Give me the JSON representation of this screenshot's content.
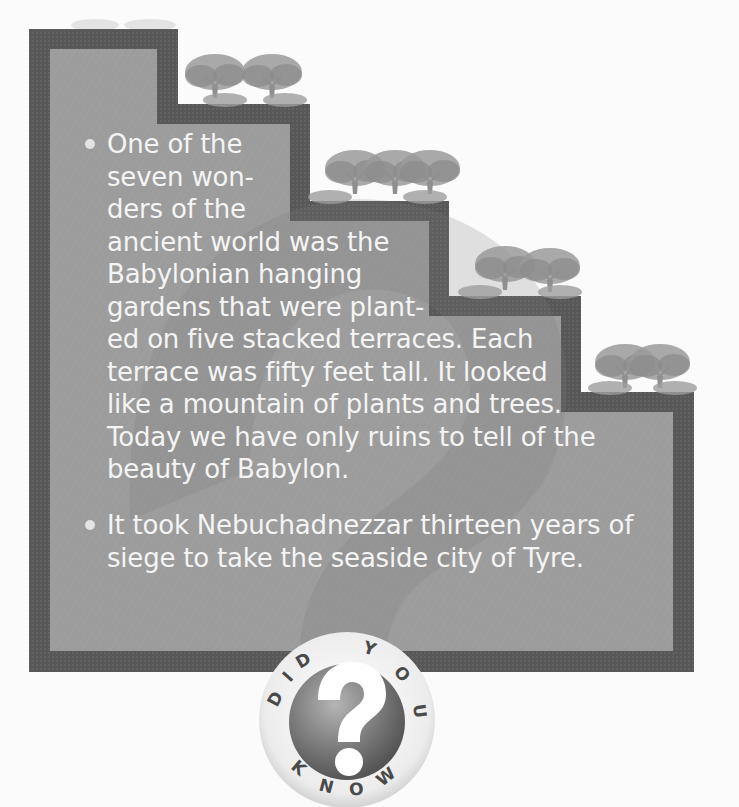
{
  "panel": {
    "title_badge": {
      "letters_top": "DID YOU",
      "letters_bottom": "KNOW",
      "text": "DID YOU KNOW",
      "icon": "question-mark-icon"
    },
    "colors": {
      "background": "#fbfbfb",
      "frame_dark": "#5a5a5a",
      "panel_fill": "#9b9b9b",
      "text": "#f4f4f4",
      "tree_foliage": "#8a8a8a"
    },
    "decoration": {
      "terrace_steps": 5,
      "icon": "tree-icon"
    }
  },
  "facts": [
    {
      "lines": [
        "One of the",
        "seven won-",
        "ders of the",
        "ancient world was the",
        "Babylonian hanging",
        "gardens that were plant-",
        "ed on five stacked terraces. Each",
        "terrace was fifty feet tall. It looked",
        "like a mountain of plants and trees.",
        "Today we have only ruins to tell of the",
        "beauty of Babylon."
      ]
    },
    {
      "lines": [
        "It took Nebuchadnezzar thirteen years of",
        "siege to take the seaside city of Tyre."
      ]
    }
  ]
}
